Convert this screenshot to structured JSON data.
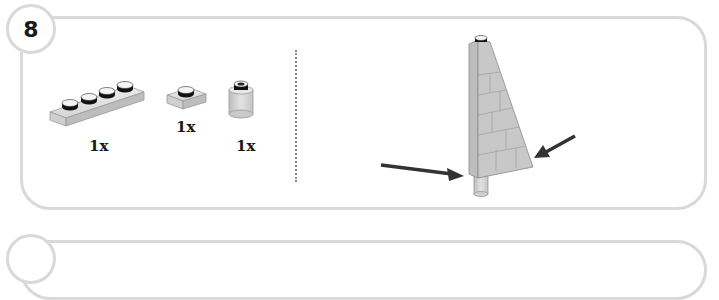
{
  "step": {
    "number": "8",
    "border_color": "#d9d9d9"
  },
  "parts_list": {
    "items": [
      {
        "name": "plate-1x4",
        "quantity": "1x"
      },
      {
        "name": "plate-1x1",
        "quantity": "1x"
      },
      {
        "name": "round-brick-1x1",
        "quantity": "1x"
      }
    ]
  },
  "assembly": {
    "model": "wedge-assembly",
    "arrows": [
      "left-arrow",
      "right-arrow"
    ],
    "arrow_color": "#333333",
    "brick_color": "#c8c8c8"
  },
  "next_step": {
    "number": ""
  }
}
